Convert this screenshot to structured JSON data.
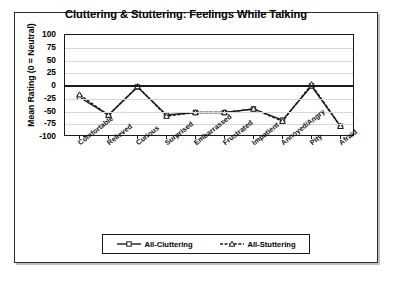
{
  "chart_data": {
    "type": "line",
    "title": "Cluttering & Stuttering: Feelings While Talking",
    "xlabel": "",
    "ylabel": "Mean Rating (0 = Neutral)",
    "ylim": [
      -100,
      100
    ],
    "yticks": [
      100,
      75,
      50,
      25,
      0,
      -25,
      -50,
      -75,
      -100
    ],
    "grid": true,
    "legend_position": "bottom",
    "categories": [
      "Comfortable",
      "Relieved",
      "Curious",
      "Surprised",
      "Embarrassed",
      "Frustrated",
      "Impatient",
      "Annoyed/Angry",
      "Pity",
      "Afraid"
    ],
    "series": [
      {
        "name": "All-Cluttering",
        "marker": "square",
        "line_style": "solid",
        "color": "#1a1a1a",
        "values": [
          -22,
          -57,
          -2,
          -57,
          -52,
          -52,
          -45,
          -67,
          0,
          -79
        ]
      },
      {
        "name": "All-Stuttering",
        "marker": "triangle",
        "line_style": "dashed",
        "color": "#1a1a1a",
        "values": [
          -17,
          -57,
          -1,
          -59,
          -52,
          -52,
          -45,
          -69,
          3,
          -79
        ]
      }
    ]
  },
  "legend": {
    "items": [
      {
        "label": "All-Cluttering"
      },
      {
        "label": "All-Stuttering"
      }
    ]
  },
  "colors": {
    "frame": "#2b2b2b",
    "axis": "#1a1a1a",
    "grid": "#d8d8d8",
    "background": "#ffffff"
  }
}
